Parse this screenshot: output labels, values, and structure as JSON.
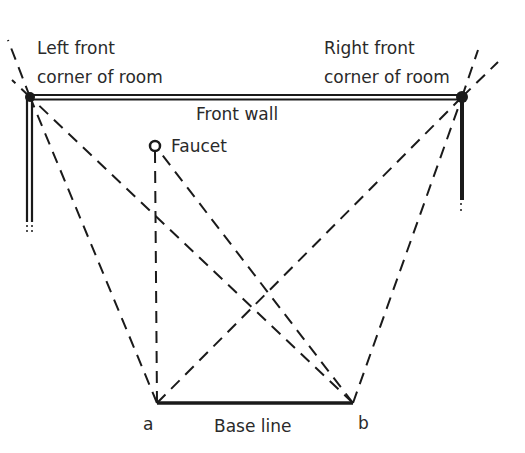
{
  "labels": {
    "left_corner_line1": "Left front",
    "left_corner_line2": "corner of room",
    "right_corner_line1": "Right front",
    "right_corner_line2": "corner of room",
    "front_wall": "Front wall",
    "faucet": "Faucet",
    "point_a": "a",
    "point_b": "b",
    "base_line": "Base line"
  },
  "points": {
    "left_corner": [
      30,
      97
    ],
    "right_corner": [
      462,
      97
    ],
    "faucet": [
      155,
      146
    ],
    "a": [
      157,
      403
    ],
    "b": [
      353,
      403
    ]
  },
  "colors": {
    "ink": "#1a1a1a",
    "background": "#ffffff"
  }
}
